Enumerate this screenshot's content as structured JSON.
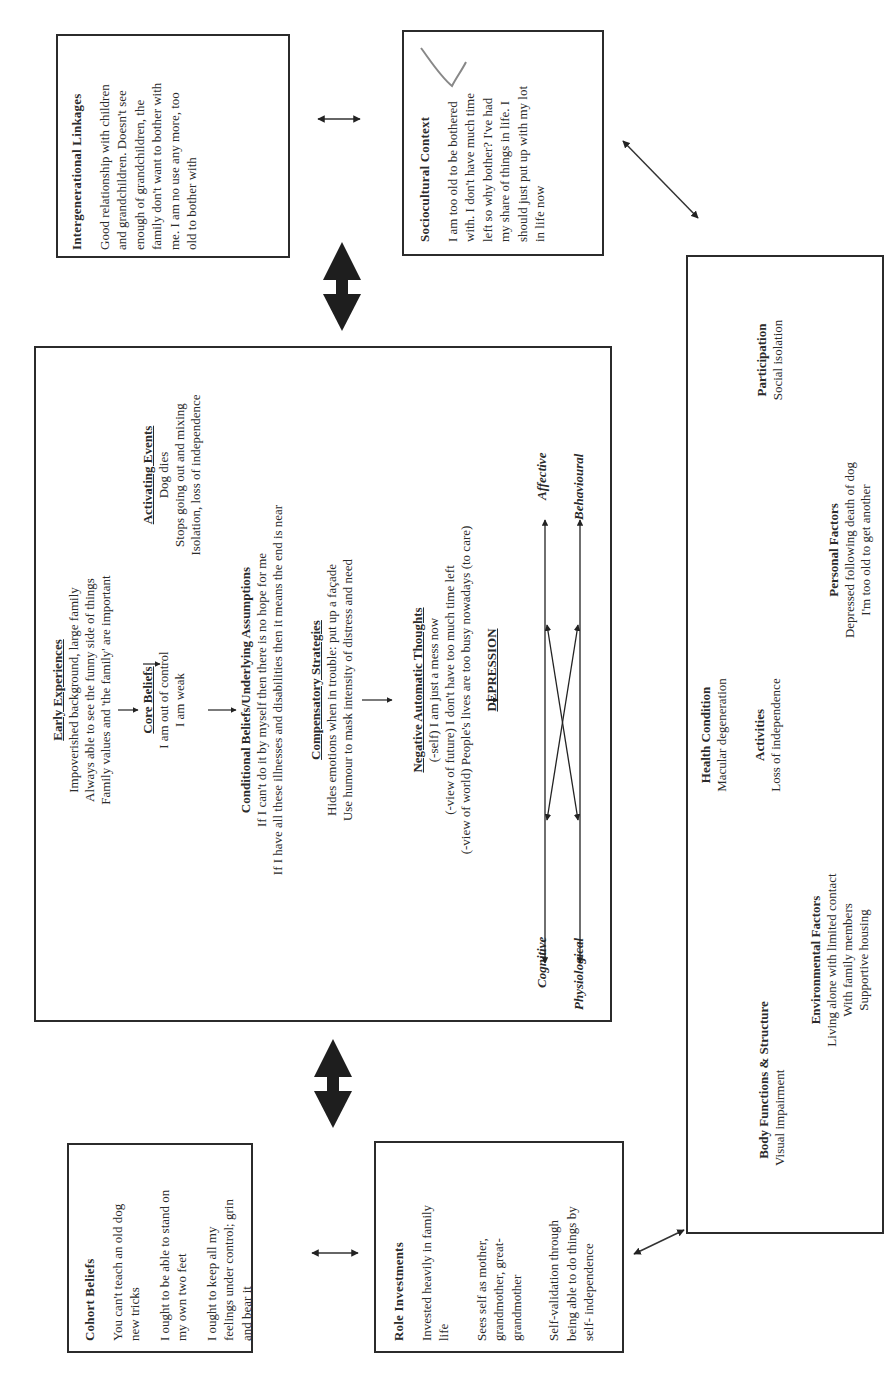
{
  "intergenerational": {
    "title": "Intergenerational Linkages",
    "lines": [
      "Good relationship with children",
      "and grandchildren. Doesn't see",
      "enough of grandchildren, the",
      "family don't want to bother with",
      "me. I am no use any more, too",
      "old to bother with"
    ]
  },
  "sociocultural": {
    "title": "Sociocultural Context",
    "lines": [
      "I am too old to be bothered",
      "with. I don't have much time",
      "left so why bother? I've had",
      "my share of things in life. I",
      "should just put up with my lot",
      "in life now"
    ]
  },
  "cbt": {
    "early_experiences": {
      "title": "Early Experiences",
      "lines": [
        "Impoverished background, large family",
        "Always able to see the funny side of things",
        "Family values and 'the family' are important"
      ]
    },
    "activating_events": {
      "title": "Activating Events",
      "lines": [
        "Dog dies",
        "Stops going out and mixing",
        "Isolation, loss of independence"
      ]
    },
    "core_beliefs": {
      "title": "Core Beliefs",
      "lines": [
        "I am out of control",
        "I am weak"
      ]
    },
    "conditional_beliefs": {
      "title": "Conditional Beliefs/Underlying Assumptions",
      "lines": [
        "If I can't do it by myself then there is no hope for me",
        "If I have all these illnesses and disabilities then it means the end is near"
      ]
    },
    "compensatory": {
      "title": "Compensatory Strategies",
      "lines": [
        "Hides emotions when in trouble: put up a façade",
        "Use humour to mask intensity of distress and need"
      ]
    },
    "nat": {
      "title": "Negative Automatic Thoughts",
      "lines": [
        "(-self) I am just a mess now",
        "(-view of future) I don't have too much time left",
        "(-view of world) People's lives are too busy nowadays (to care)"
      ]
    },
    "depression": "DEPRESSION",
    "cycle": {
      "cognitive": "Cognitive",
      "affective": "Affective",
      "physiological": "Physiological",
      "behavioural": "Behavioural"
    }
  },
  "icf": {
    "health_condition": {
      "title": "Health Condition",
      "lines": [
        "Macular degeneration"
      ]
    },
    "body_functions": {
      "title": "Body Functions & Structure",
      "lines": [
        "Visual impairment"
      ]
    },
    "activities": {
      "title": "Activities",
      "lines": [
        "Loss of independence"
      ]
    },
    "participation": {
      "title": "Participation",
      "lines": [
        "Social isolation"
      ]
    },
    "environmental": {
      "title": "Environmental Factors",
      "lines": [
        "Living alone with limited contact",
        "With family members",
        "Supportive housing"
      ]
    },
    "personal": {
      "title": "Personal Factors",
      "lines": [
        "Depressed following death of dog",
        "I'm too old to get another"
      ]
    }
  },
  "cohort": {
    "title": "Cohort  Beliefs",
    "paragraphs": [
      [
        "You can't teach an old dog",
        "new tricks"
      ],
      [
        "I ought to be able to stand on",
        "my own two feet"
      ],
      [
        "I ought to keep all my",
        "feelings under control; grin",
        "and bear it"
      ]
    ]
  },
  "role": {
    "title": "Role Investments",
    "paragraphs": [
      [
        "Invested heavily in family",
        "life"
      ],
      [
        "Sees self as mother,",
        "grandmother, great-",
        "grandmother"
      ],
      [
        "Self-validation through",
        "being able to do things by",
        "self- independence"
      ]
    ]
  }
}
